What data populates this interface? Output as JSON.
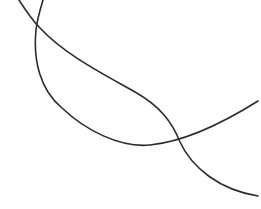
{
  "canvas": {
    "width": 261,
    "height": 209,
    "background": "#ffffff"
  },
  "curves": [
    {
      "name": "curve-a",
      "color": "#2b2b2b",
      "stroke_width": 1.6,
      "path": "M 19 0 C 28 14, 34 22, 40 28 C 65 55, 105 75, 135 92 C 160 106, 172 122, 180 142 C 192 168, 220 190, 258 196"
    },
    {
      "name": "curve-b",
      "color": "#2b2b2b",
      "stroke_width": 1.6,
      "path": "M 43 0 C 40 10, 37 20, 36 30 C 33 60, 40 90, 62 108 C 85 130, 120 148, 150 145 C 180 142, 215 128, 258 101"
    }
  ]
}
